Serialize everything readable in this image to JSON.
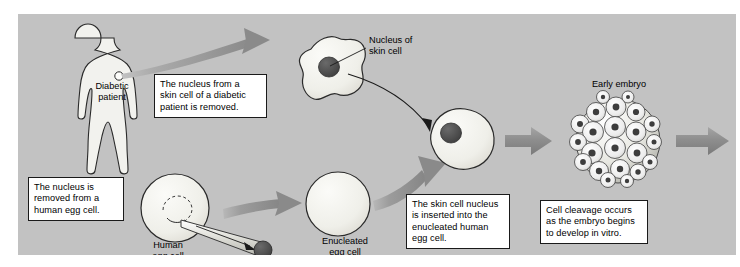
{
  "figure": {
    "panel_background": "#c2c2c2",
    "callout_background": "#ffffff",
    "callout_border": "#1a1a1a",
    "arrow_color": "#8c8c8c",
    "nucleus_color": "#4a4a4a",
    "cell_fill": "#f0f0ec"
  },
  "labels": {
    "diabetic_patient": "Diabetic\npatient",
    "nucleus_of_skin_cell": "Nucleus of\nskin cell",
    "human_egg_cell": "Human\negg cell",
    "enucleated_egg_cell": "Enucleated\negg cell",
    "early_embryo": "Early embryo"
  },
  "callouts": {
    "skin_nucleus_removed": "The nucleus from a\nskin cell of a diabetic\npatient is removed.",
    "egg_nucleus_removed": "The nucleus is\nremoved from a\nhuman egg cell.",
    "nucleus_inserted": "The skin cell nucleus\nis inserted into the\nenucleated human\negg cell.",
    "cell_cleavage": "Cell cleavage occurs\nas the embryo begins\nto develop in vitro."
  },
  "icons": {
    "patient": "human-silhouette-icon",
    "skin_cell": "skin-cell-icon",
    "egg_cell": "egg-cell-icon",
    "pipette": "micropipette-icon",
    "embryo": "morula-embryo-icon",
    "arrow": "block-arrow-icon",
    "curved_arrow": "curved-arrow-icon",
    "leader_line": "leader-line-icon"
  }
}
